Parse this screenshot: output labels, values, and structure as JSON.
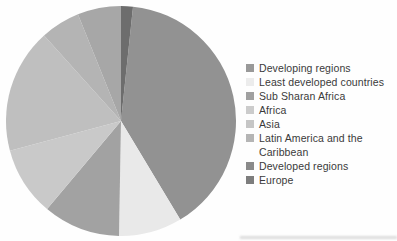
{
  "chart_data": {
    "type": "pie",
    "legend_position": "right",
    "layout": {
      "cx": 121,
      "cy": 121,
      "r": 115
    },
    "slices": [
      {
        "label": "Developing regions",
        "start_deg": 6,
        "end_deg": 149,
        "percent": 39.7,
        "color": "#929292"
      },
      {
        "label": "Least developed countries",
        "start_deg": 149,
        "end_deg": 181,
        "percent": 8.9,
        "color": "#e9e9e9"
      },
      {
        "label": "Sub Sharan Africa",
        "start_deg": 181,
        "end_deg": 220,
        "percent": 10.8,
        "color": "#a2a2a2"
      },
      {
        "label": "Africa",
        "start_deg": 220,
        "end_deg": 255,
        "percent": 9.7,
        "color": "#c9c9c9"
      },
      {
        "label": "Asia",
        "start_deg": 255,
        "end_deg": 318,
        "percent": 17.5,
        "color": "#bfbfbf"
      },
      {
        "label": "Latin America and the Caribbean",
        "start_deg": 318,
        "end_deg": 338,
        "percent": 5.6,
        "color": "#b4b4b4"
      },
      {
        "label": "Developed regions",
        "start_deg": 338,
        "end_deg": 360,
        "percent": 6.1,
        "color": "#a7a7a7"
      },
      {
        "label": "Europe",
        "start_deg": 0,
        "end_deg": 6,
        "percent": 1.7,
        "color": "#6d6d6d"
      }
    ]
  },
  "legend": {
    "text_color": "#3a3a3a",
    "items": [
      {
        "label": "Developing regions",
        "color": "#999999"
      },
      {
        "label": "Least developed countries",
        "color": "#ececec"
      },
      {
        "label": "Sub Sharan Africa",
        "color": "#a0a0a0"
      },
      {
        "label": "Africa",
        "color": "#cccccc"
      },
      {
        "label": "Asia",
        "color": "#c6c6c6"
      },
      {
        "label": "Latin America and the Caribbean",
        "color": "#b5b5b5"
      },
      {
        "label": "Developed regions",
        "color": "#8a8a8a"
      },
      {
        "label": "Europe",
        "color": "#7d7d7d"
      }
    ]
  }
}
